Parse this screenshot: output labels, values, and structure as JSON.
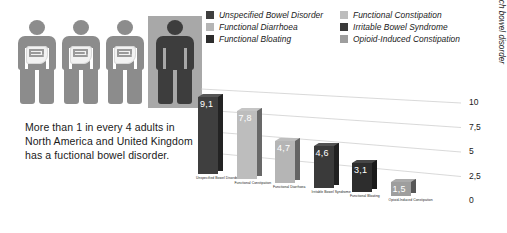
{
  "caption": {
    "text": "More than 1 in every 4 adults in North America and United Kingdom has a fuctional bowel disorder."
  },
  "figures": {
    "total": 4,
    "highlighted_index": 3,
    "figure_color": "#8c8c8c",
    "highlight_figure_color": "#3d3d3d",
    "highlight_box_color": "#a8a8a8",
    "gut_icon": "intestine-icon"
  },
  "legend": {
    "columns": [
      {
        "items": [
          {
            "label": "Unspecified Bowel Disorder",
            "color": "#3f3f3f"
          },
          {
            "label": "Functional Diarrhoea",
            "color": "#b5b5b5"
          },
          {
            "label": "Functional Bloating",
            "color": "#2d2d2d"
          }
        ]
      },
      {
        "items": [
          {
            "label": "Functional Constipation",
            "color": "#bdbdbd"
          },
          {
            "label": "Irritable Bowel Syndrome",
            "color": "#3a3a3a"
          },
          {
            "label": "Opioid-Induced Constipation",
            "color": "#9e9e9e"
          }
        ]
      }
    ]
  },
  "chart_data": {
    "type": "bar",
    "title": "",
    "xlabel": "",
    "ylabel": "% of adults with each bowel disorder",
    "ylim": [
      0,
      10
    ],
    "ticks": [
      "10",
      "7,5",
      "5",
      "2,5",
      "0"
    ],
    "tick_values": [
      10,
      7.5,
      5,
      2.5,
      0
    ],
    "grid": true,
    "legend_position": "top",
    "categories": [
      "Unspecified Bowel Disorder",
      "Functional Constipation",
      "Functional Diarrhoea",
      "Irritable Bowel Syndrome",
      "Functional Bloating",
      "Opioid-Induced Constipation"
    ],
    "values": [
      9.1,
      7.8,
      4.7,
      4.6,
      3.1,
      1.5
    ],
    "value_labels": [
      "9,1",
      "7,8",
      "4,7",
      "4,6",
      "3,1",
      "1,5"
    ],
    "colors": [
      "#3f3f3f",
      "#bdbdbd",
      "#b5b5b5",
      "#3a3a3a",
      "#2d2d2d",
      "#9e9e9e"
    ]
  }
}
